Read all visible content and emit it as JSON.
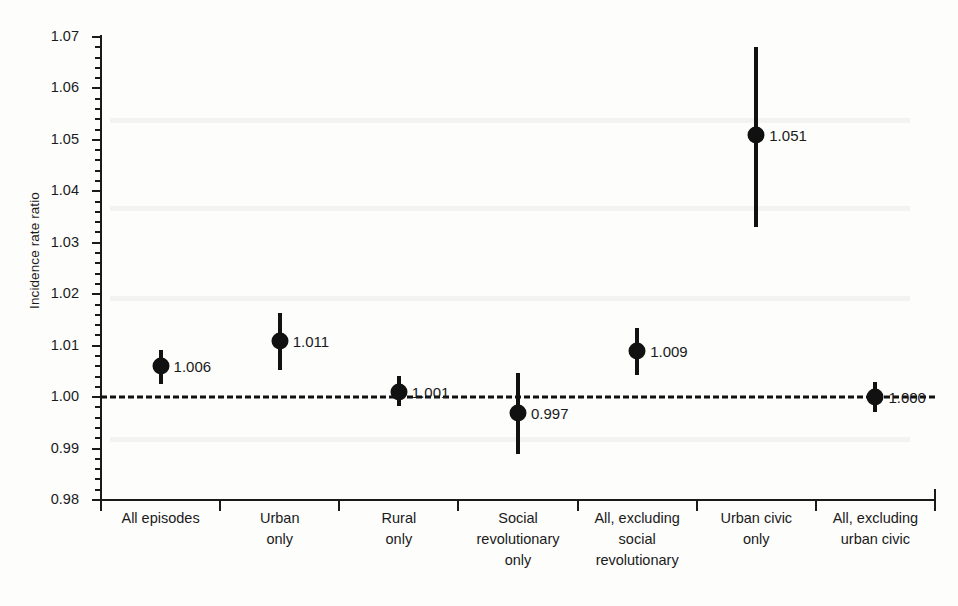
{
  "chart_data": {
    "type": "scatter",
    "title": "",
    "xlabel": "",
    "ylabel": "Incidence rate ratio",
    "ylim": [
      0.98,
      1.07
    ],
    "ytick_labels": [
      "1.07",
      "1.06",
      "1.05",
      "1.04",
      "1.03",
      "1.02",
      "1.01",
      "1.00",
      "0.99",
      "0.98"
    ],
    "ytick_values": [
      1.07,
      1.06,
      1.05,
      1.04,
      1.03,
      1.02,
      1.01,
      1.0,
      0.99,
      0.98
    ],
    "minor_tick_step": 0.002,
    "grid": false,
    "legend": "none",
    "reference_line": {
      "value": 1.0,
      "style": "dashed",
      "color": "#111111",
      "label": ""
    },
    "categories": [
      "All episodes",
      "Urban only",
      "Rural only",
      "Social revolutionary only",
      "All, excluding social revolutionary",
      "Urban civic only",
      "All, excluding urban civic"
    ],
    "category_label_lines": [
      [
        "All episodes"
      ],
      [
        "Urban",
        "only"
      ],
      [
        "Rural",
        "only"
      ],
      [
        "Social",
        "revolutionary",
        "only"
      ],
      [
        "All, excluding",
        "social",
        "revolutionary"
      ],
      [
        "Urban civic",
        "only"
      ],
      [
        "All, excluding",
        "urban civic"
      ]
    ],
    "values": [
      1.006,
      1.011,
      1.001,
      0.997,
      1.009,
      1.051,
      1.0
    ],
    "value_labels": [
      "1.006",
      "1.011",
      "1.001",
      "0.997",
      "1.009",
      "1.051",
      "1.000"
    ],
    "ci_lower": [
      1.0025,
      1.0052,
      0.9983,
      0.989,
      1.0043,
      1.033,
      0.9972
    ],
    "ci_upper": [
      1.0092,
      1.0164,
      1.0042,
      1.0046,
      1.0135,
      1.068,
      1.0029
    ],
    "marker": "filled-circle",
    "marker_color": "#111111",
    "errorbar_color": "#111111"
  }
}
